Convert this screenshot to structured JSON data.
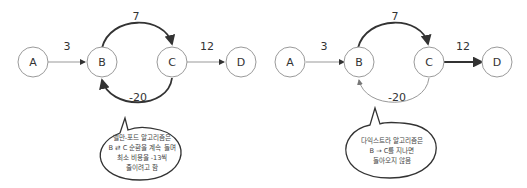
{
  "diagrams": [
    {
      "name": "bellman-ford",
      "nodes": [
        "A",
        "B",
        "C",
        "D"
      ],
      "edges": [
        {
          "from": "A",
          "to": "B",
          "weight": "3"
        },
        {
          "from": "B",
          "to": "C",
          "weight": "7"
        },
        {
          "from": "C",
          "to": "B",
          "weight": "-20"
        },
        {
          "from": "C",
          "to": "D",
          "weight": "12"
        }
      ],
      "bubble": [
        "벨만-포드 알고리즘은",
        "B ⇄ C 순환을 계속 돌며",
        "최소 비용을 -13씩",
        "줄이려고 함"
      ]
    },
    {
      "name": "dijkstra",
      "nodes": [
        "A",
        "B",
        "C",
        "D"
      ],
      "edges": [
        {
          "from": "A",
          "to": "B",
          "weight": "3"
        },
        {
          "from": "B",
          "to": "C",
          "weight": "7"
        },
        {
          "from": "C",
          "to": "B",
          "weight": "-20"
        },
        {
          "from": "C",
          "to": "D",
          "weight": "12"
        }
      ],
      "bubble": [
        "다익스트라 알고리즘은",
        "B → C를 지나면",
        "돌아오지 않음"
      ]
    }
  ],
  "colors": {
    "node_stroke": "#9a9a9a",
    "edge_dark": "#333333",
    "edge_light": "#999999"
  }
}
